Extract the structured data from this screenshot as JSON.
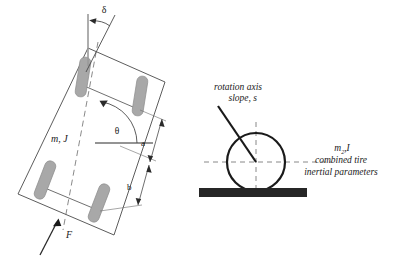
{
  "figure": {
    "background_color": "#ffffff",
    "line_color": "#3a3a3a",
    "heavy_line_color": "#1a1a1a",
    "tire_fill_color": "#a8a8a8",
    "tire_stroke_color": "#8a8a8a",
    "ground_color": "#262626",
    "dash_color": "#6b6b6b",
    "width": 401,
    "height": 265
  },
  "left_panel": {
    "name": "vehicle-plan-view",
    "labels": {
      "steer_angle": "δ",
      "heading_angle": "θ",
      "mass_inertia": "m, J",
      "dim_front": "a",
      "dim_rear": "b",
      "force": "F"
    },
    "tires": [
      {
        "name": "front-left-tire"
      },
      {
        "name": "front-right-tire"
      },
      {
        "name": "rear-left-tire"
      },
      {
        "name": "rear-right-tire"
      }
    ]
  },
  "right_panel": {
    "name": "tire-rotation-axis-view",
    "labels": {
      "rotation_axis_line1": "rotation axis",
      "rotation_axis_line2": "slope, s",
      "tire_params_symbol_base": "m",
      "tire_params_symbol_sub": "2",
      "tire_params_symbol_tail": ",I",
      "tire_params_line1": "combined tire",
      "tire_params_line2": "inertial parameters"
    },
    "elements": [
      {
        "name": "tire-circle"
      },
      {
        "name": "ground-bar"
      },
      {
        "name": "rotation-axis-line"
      },
      {
        "name": "horizontal-centerline"
      },
      {
        "name": "vertical-centerline"
      }
    ]
  }
}
